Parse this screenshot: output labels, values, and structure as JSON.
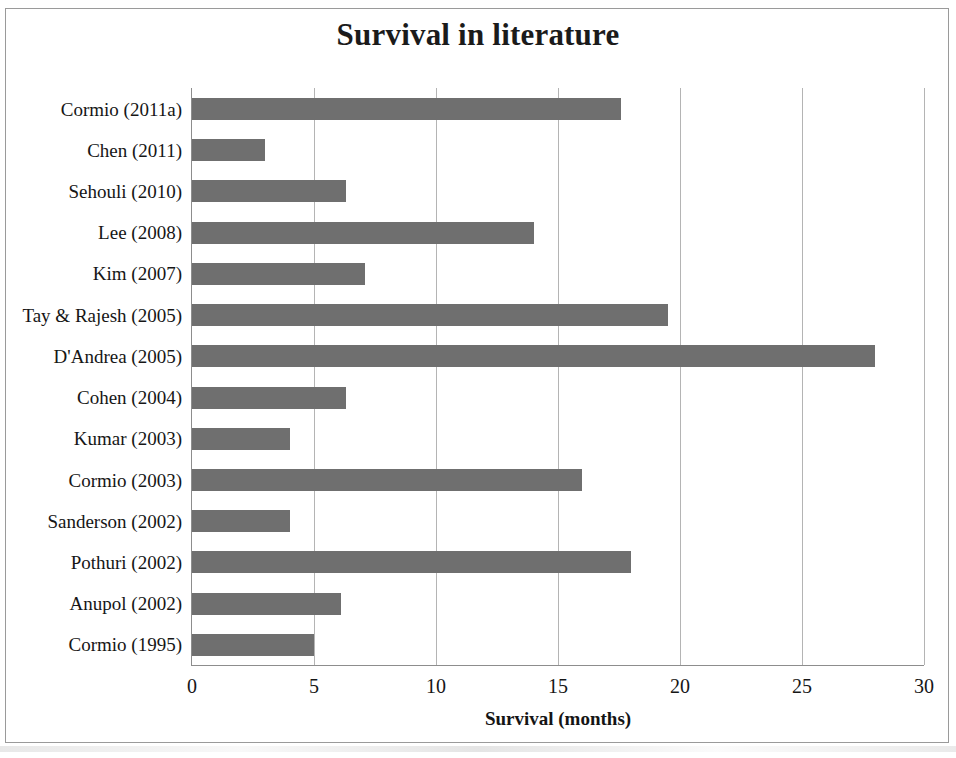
{
  "chart_data": {
    "type": "bar",
    "orientation": "horizontal",
    "title": "Survival in literature",
    "xlabel": "Survival (months)",
    "ylabel": "",
    "xlim": [
      0,
      30
    ],
    "xticks": [
      0,
      5,
      10,
      15,
      20,
      25,
      30
    ],
    "xtick_labels": [
      "0",
      "5",
      "10",
      "15",
      "20",
      "25",
      "30"
    ],
    "grid": "vertical",
    "legend": "none",
    "bar_color": "#6f6f6f",
    "categories": [
      "Cormio (2011a)",
      "Chen (2011)",
      "Sehouli (2010)",
      "Lee (2008)",
      "Kim (2007)",
      "Tay & Rajesh (2005)",
      "D'Andrea (2005)",
      "Cohen (2004)",
      "Kumar (2003)",
      "Cormio (2003)",
      "Sanderson (2002)",
      "Pothuri (2002)",
      "Anupol (2002)",
      "Cormio (1995)"
    ],
    "values": [
      17.6,
      3.0,
      6.3,
      14.0,
      7.1,
      19.5,
      28.0,
      6.3,
      4.0,
      16.0,
      4.0,
      18.0,
      6.1,
      5.0
    ]
  }
}
